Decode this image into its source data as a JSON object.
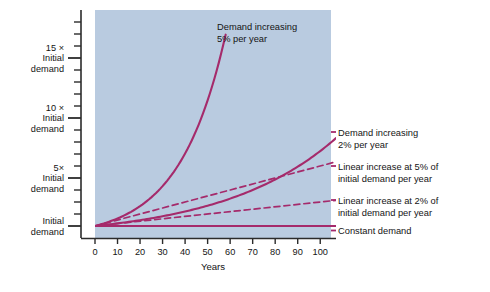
{
  "figure": {
    "plot_background_color": "#b9cbe0",
    "page_background_color": "#ffffff",
    "curve_color": "#a52a6b",
    "axis_color": "#2b2b2b",
    "text_color": "#141414"
  },
  "chart_data": {
    "type": "line",
    "title": "",
    "xlabel": "Years",
    "ylabel": "",
    "xlim": [
      0,
      107
    ],
    "ylim": [
      0,
      19
    ],
    "grid": false,
    "legend_position": "right-inline-annotations",
    "x_ticks": [
      0,
      10,
      20,
      30,
      40,
      50,
      60,
      70,
      80,
      90,
      100
    ],
    "x_tick_labels": [
      "0",
      "10",
      "20",
      "30",
      "40",
      "50",
      "60",
      "70",
      "80",
      "90",
      "100"
    ],
    "y_major_ticks": [
      1,
      5,
      10,
      15
    ],
    "y_major_tick_labels": [
      "Initial demand",
      "5× Initial demand",
      "10 × Initial demand",
      "15 × Initial demand"
    ],
    "y_minor_tick_step": 1,
    "y_axis_unit_note": "multiples of initial demand",
    "series": [
      {
        "name": "Demand increasing 5% per year",
        "style": "solid",
        "formula": "1.05^t",
        "x": [
          0,
          5,
          10,
          15,
          20,
          25,
          30,
          35,
          40,
          45,
          50,
          55,
          58
        ],
        "values": [
          1.0,
          1.28,
          1.63,
          2.08,
          2.65,
          3.39,
          4.32,
          5.52,
          7.04,
          8.99,
          11.47,
          14.64,
          16.9
        ]
      },
      {
        "name": "Demand increasing 2% per year",
        "style": "solid",
        "formula": "1.02^t",
        "x": [
          0,
          10,
          20,
          30,
          40,
          50,
          60,
          70,
          80,
          90,
          100,
          107
        ],
        "values": [
          1.0,
          1.22,
          1.49,
          1.81,
          2.21,
          2.69,
          3.28,
          4.0,
          4.88,
          5.94,
          7.24,
          8.3
        ]
      },
      {
        "name": "Linear increase at 5% of initial demand per year",
        "style": "dashed",
        "formula": "1 + 0.05t",
        "x": [
          0,
          107
        ],
        "values": [
          1.0,
          6.35
        ]
      },
      {
        "name": "Linear increase at 2% of initial demand per year",
        "style": "dashed",
        "formula": "1 + 0.02t",
        "x": [
          0,
          107
        ],
        "values": [
          1.0,
          3.14
        ]
      },
      {
        "name": "Constant demand",
        "style": "solid",
        "formula": "1",
        "x": [
          0,
          107
        ],
        "values": [
          1.0,
          1.0
        ]
      }
    ]
  },
  "y_axis_labels": [
    {
      "id": "y-15x",
      "lines": [
        "15 ×",
        "Initial",
        "demand"
      ],
      "value": 15
    },
    {
      "id": "y-10x",
      "lines": [
        "10 ×",
        "Initial",
        "demand"
      ],
      "value": 10
    },
    {
      "id": "y-5x",
      "lines": [
        "5×",
        "Initial",
        "demand"
      ],
      "value": 5
    },
    {
      "id": "y-1x",
      "lines": [
        "Initial",
        "demand"
      ],
      "value": 1
    }
  ],
  "annotations": {
    "inside_top": {
      "line1": "Demand increasing",
      "line2": "5% per year"
    },
    "right": [
      {
        "id": "annot-2pct-exponential",
        "line1": "Demand increasing",
        "line2": "2% per year"
      },
      {
        "id": "annot-linear-5pct",
        "line1": "Linear increase at 5% of",
        "line2": "initial demand per year"
      },
      {
        "id": "annot-linear-2pct",
        "line1": "Linear increase at 2% of",
        "line2": "initial demand per year"
      },
      {
        "id": "annot-constant",
        "line1": "Constant demand",
        "line2": ""
      }
    ]
  },
  "x_axis": {
    "title": "Years",
    "tick_labels": [
      "0",
      "10",
      "20",
      "30",
      "40",
      "50",
      "60",
      "70",
      "80",
      "90",
      "100"
    ]
  }
}
